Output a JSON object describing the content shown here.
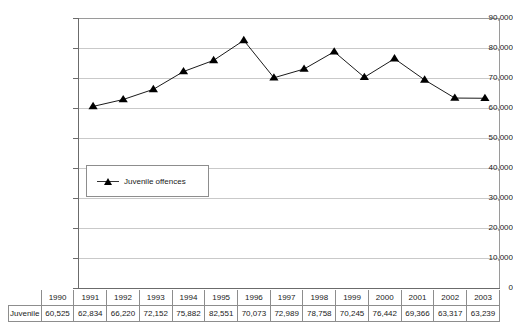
{
  "chart_data": {
    "type": "line",
    "title": "",
    "xlabel": "",
    "ylabel": "",
    "categories": [
      "1990",
      "1991",
      "1992",
      "1993",
      "1994",
      "1995",
      "1996",
      "1997",
      "1998",
      "1999",
      "2000",
      "2001",
      "2002",
      "2003"
    ],
    "series": [
      {
        "name": "Juvenile offences",
        "values": [
          60525,
          62834,
          66220,
          72152,
          75882,
          82551,
          70073,
          72989,
          78758,
          70245,
          76442,
          69366,
          63317,
          63239
        ],
        "marker": "triangle",
        "color": "#000000"
      }
    ],
    "ylim": [
      0,
      90000
    ],
    "ytick_step": 10000,
    "ytick_labels": [
      "90,000",
      "80,000",
      "70,000",
      "60,000",
      "50,000",
      "40,000",
      "30,000",
      "20,000",
      "10,000",
      "0"
    ],
    "grid": true,
    "legend_position": "inside-lower-left"
  },
  "legend": {
    "entries": [
      {
        "label": "Juvenile offences",
        "marker_icon": "triangle-marker-icon"
      }
    ]
  },
  "table": {
    "row_label": "Juvenile offences",
    "columns": [
      "1990",
      "1991",
      "1992",
      "1993",
      "1994",
      "1995",
      "1996",
      "1997",
      "1998",
      "1999",
      "2000",
      "2001",
      "2002",
      "2003"
    ],
    "values": [
      "60,525",
      "62,834",
      "66,220",
      "72,152",
      "75,882",
      "82,551",
      "70,073",
      "72,989",
      "78,758",
      "70,245",
      "76,442",
      "69,366",
      "63,317",
      "63,239"
    ]
  },
  "colors": {
    "series": "#000000",
    "gridline": "#c9c9c9",
    "axis": "#6b6b6b",
    "border": "#8d8d8d",
    "background": "#ffffff",
    "text": "#1a1a1a"
  }
}
